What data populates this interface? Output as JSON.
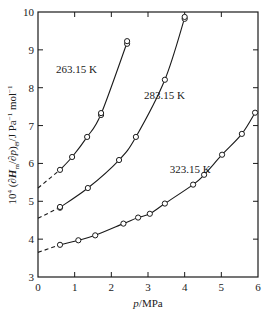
{
  "chart_data": {
    "type": "line",
    "title": "",
    "xlabel": "p/MPa",
    "ylabel": "10^4 (∂H_m/∂p)_Θ / J Pa^-1 mol^-1",
    "xlim": [
      0,
      6
    ],
    "ylim": [
      3,
      10
    ],
    "xticks": [
      0,
      1,
      2,
      3,
      4,
      5,
      6
    ],
    "yticks": [
      3,
      4,
      5,
      6,
      7,
      8,
      9,
      10
    ],
    "grid": false,
    "legend": "none (inline curve labels)",
    "series": [
      {
        "name": "263.15 K",
        "label_pos": [
          1.05,
          8.4
        ],
        "intercept": 5.35,
        "points": [
          [
            0.6,
            5.83
          ],
          [
            0.93,
            6.17
          ],
          [
            1.34,
            6.7
          ],
          [
            1.72,
            7.28
          ],
          [
            1.72,
            7.33
          ],
          [
            2.43,
            9.16
          ],
          [
            2.43,
            9.23
          ]
        ]
      },
      {
        "name": "283.15 K",
        "label_pos": [
          3.45,
          7.7
        ],
        "intercept": 4.55,
        "points": [
          [
            0.6,
            4.83
          ],
          [
            0.6,
            4.85
          ],
          [
            1.36,
            5.35
          ],
          [
            2.21,
            6.09
          ],
          [
            2.67,
            6.7
          ],
          [
            3.46,
            8.21
          ],
          [
            4.0,
            9.82
          ],
          [
            4.0,
            9.87
          ]
        ]
      },
      {
        "name": "323.15 K",
        "label_pos": [
          4.15,
          5.75
        ],
        "intercept": 3.65,
        "points": [
          [
            0.6,
            3.85
          ],
          [
            1.1,
            3.97
          ],
          [
            1.56,
            4.1
          ],
          [
            2.33,
            4.41
          ],
          [
            2.73,
            4.57
          ],
          [
            3.05,
            4.67
          ],
          [
            3.46,
            4.94
          ],
          [
            4.23,
            5.44
          ],
          [
            4.53,
            5.7
          ],
          [
            5.02,
            6.23
          ],
          [
            5.56,
            6.78
          ],
          [
            5.92,
            7.34
          ]
        ]
      }
    ]
  },
  "axes": {
    "x_label_italic": "p",
    "x_label_rest": "/MPa",
    "y_label_parts": [
      "10",
      "4",
      " (∂",
      "H",
      "m",
      "/∂",
      "p",
      ")",
      "Θ",
      "/J Pa",
      "−1",
      " mol",
      "−1"
    ]
  }
}
